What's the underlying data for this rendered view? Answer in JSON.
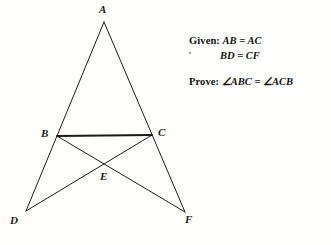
{
  "figure": {
    "background_color": "#fffffe",
    "stroke_color": "#1a1a1a",
    "vertices": [
      {
        "id": "A",
        "label": "A",
        "x": 104,
        "y": 22,
        "label_x": 99,
        "label_y": 4
      },
      {
        "id": "B",
        "label": "B",
        "x": 57,
        "y": 136,
        "label_x": 41,
        "label_y": 128
      },
      {
        "id": "C",
        "label": "C",
        "x": 152,
        "y": 135,
        "label_x": 158,
        "label_y": 127
      },
      {
        "id": "D",
        "label": "D",
        "x": 26,
        "y": 211,
        "label_x": 10,
        "label_y": 215
      },
      {
        "id": "E",
        "label": "E",
        "x": 104,
        "y": 163,
        "label_x": 100,
        "label_y": 171
      },
      {
        "id": "F",
        "label": "F",
        "x": 185,
        "y": 212,
        "label_x": 185,
        "label_y": 214
      }
    ],
    "segments": [
      {
        "name": "segment-A-D",
        "from": "A",
        "to": "D",
        "width": 1.0
      },
      {
        "name": "segment-A-F",
        "from": "A",
        "to": "F",
        "width": 1.0
      },
      {
        "name": "segment-B-C",
        "from": "B",
        "to": "C",
        "width": 1.8
      },
      {
        "name": "segment-B-F",
        "from": "B",
        "to": "F",
        "width": 1.0
      },
      {
        "name": "segment-C-D",
        "from": "C",
        "to": "D",
        "width": 1.0
      }
    ]
  },
  "proof": {
    "given_keyword": "Given:",
    "given_line_1": "AB = AC",
    "given_line_2": "BD = CF",
    "prove_keyword": "Prove:",
    "prove_angle_1": "ABC",
    "prove_angle_2": "ACB",
    "angle_symbol": "∠",
    "equals": "=",
    "prove_statement": "∠ABC = ∠ACB"
  }
}
